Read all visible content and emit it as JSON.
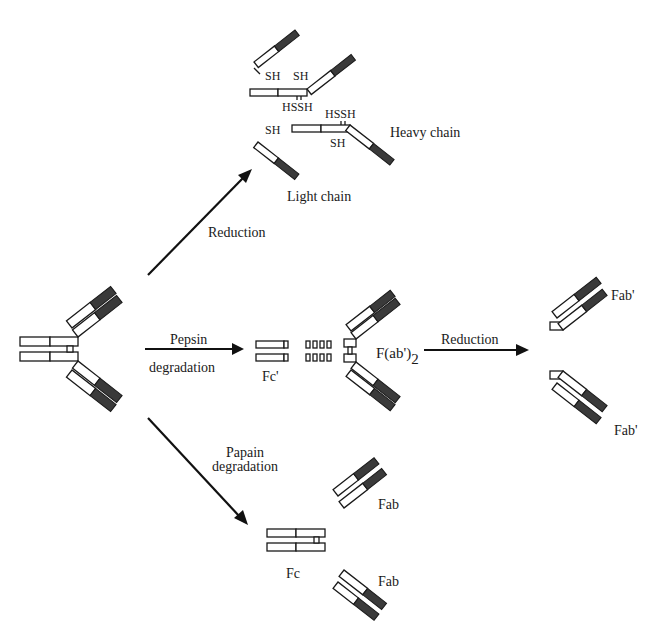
{
  "figure": {
    "colors": {
      "outline": "#1a1a1a",
      "constant_region": "#3a3a3a",
      "fill": "#ffffff"
    }
  },
  "labels": {
    "reduction_top": "Reduction",
    "pepsin": "Pepsin",
    "pepsin_degradation": "degradation",
    "papain": "Papain",
    "papain_degradation": "degradation",
    "reduction_right": "Reduction",
    "heavy_chain": "Heavy chain",
    "light_chain": "Light chain",
    "sh_1": "SH",
    "sh_2": "SH",
    "hssh_1": "HSSH",
    "hssh_2": "HSSH",
    "sh_3": "SH",
    "sh_4": "SH",
    "fc_prime": "Fc'",
    "fab2_main": "F(ab')",
    "fab2_sub": "2",
    "fab_prime_top": "Fab'",
    "fab_prime_bottom": "Fab'",
    "fab_top": "Fab",
    "fab_bottom": "Fab",
    "fc": "Fc"
  }
}
